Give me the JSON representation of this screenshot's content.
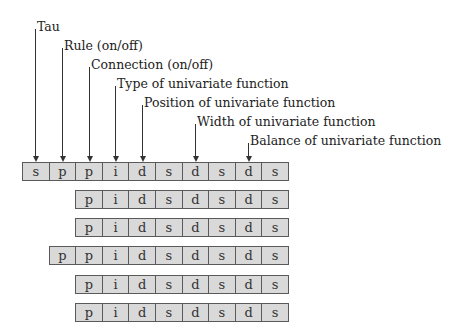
{
  "labels": [
    {
      "text": "Tau",
      "target_index": 0
    },
    {
      "text": "Rule (on/off)",
      "target_index": 1
    },
    {
      "text": "Connection (on/off)",
      "target_index": 2
    },
    {
      "text": "Type of univariate function",
      "target_index": 3
    },
    {
      "text": "Position of univariate function",
      "target_index": 4
    },
    {
      "text": "Width of univariate function",
      "target_index": 6
    },
    {
      "text": "Balance of univariate function",
      "target_index": 8
    }
  ],
  "rows": [
    {
      "offset_cells": 0,
      "cells": [
        "s",
        "p",
        "p",
        "i",
        "d",
        "s",
        "d",
        "s",
        "d",
        "s"
      ]
    },
    {
      "offset_cells": 2,
      "cells": [
        "p",
        "i",
        "d",
        "s",
        "d",
        "s",
        "d",
        "s"
      ]
    },
    {
      "offset_cells": 2,
      "cells": [
        "p",
        "i",
        "d",
        "s",
        "d",
        "s",
        "d",
        "s"
      ]
    },
    {
      "offset_cells": 1,
      "cells": [
        "p",
        "p",
        "i",
        "d",
        "s",
        "d",
        "s",
        "d",
        "s"
      ]
    },
    {
      "offset_cells": 2,
      "cells": [
        "p",
        "i",
        "d",
        "s",
        "d",
        "s",
        "d",
        "s"
      ]
    },
    {
      "offset_cells": 2,
      "cells": [
        "p",
        "i",
        "d",
        "s",
        "d",
        "s",
        "d",
        "s"
      ]
    }
  ],
  "colors": {
    "cell_fill": "#d9d9d9",
    "cell_border": "#5a5a5a",
    "line": "#333333"
  }
}
